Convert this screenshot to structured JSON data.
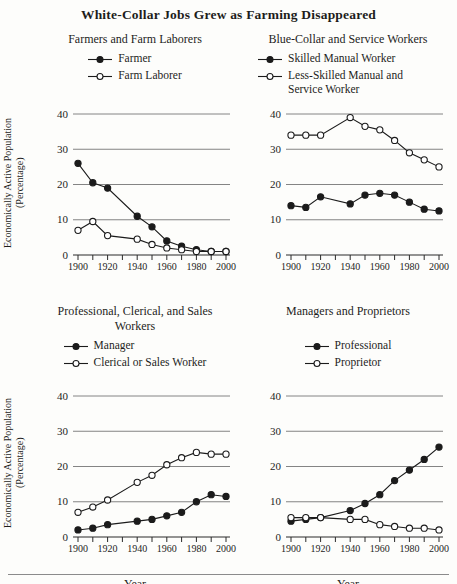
{
  "figure_title": "White-Collar Jobs Grew as Farming Disappeared",
  "y_axis_label": {
    "line1": "Economically Active Population",
    "line2": "(Percentage)"
  },
  "axes": {
    "y_ticks": [
      "0",
      "10",
      "20",
      "30",
      "40"
    ],
    "x_tick_labels": [
      "1900",
      "1920",
      "1940",
      "1960",
      "1980",
      "2000"
    ],
    "x_minor_tick_step_years": 10,
    "ylim": [
      0,
      40
    ],
    "xlim": [
      1900,
      2000
    ],
    "grid": "horizontal-only",
    "legend_position": "above-plot"
  },
  "colors": {
    "line": "#1b1b1b",
    "grid": "#767676",
    "axis": "#2b2b2b",
    "background": "#fdfdfb",
    "open_marker_fill": "#ffffff"
  },
  "chart_data": [
    {
      "type": "line",
      "title": "Farmers and Farm Laborers",
      "xlabel": "",
      "ylim": [
        0,
        40
      ],
      "x": [
        1900,
        1910,
        1920,
        1940,
        1950,
        1960,
        1970,
        1980,
        1990,
        2000
      ],
      "series": [
        {
          "name": "Farmer",
          "marker": "filled",
          "values": [
            26,
            20.5,
            19,
            11,
            8,
            4,
            2.5,
            1.5,
            1,
            1
          ]
        },
        {
          "name": "Farm Laborer",
          "marker": "open",
          "values": [
            7,
            9.5,
            5.5,
            4.5,
            3,
            2,
            1.5,
            1,
            1,
            1
          ]
        }
      ]
    },
    {
      "type": "line",
      "title": "Blue-Collar and Service Workers",
      "xlabel": "",
      "ylim": [
        0,
        40
      ],
      "x": [
        1900,
        1910,
        1920,
        1940,
        1950,
        1960,
        1970,
        1980,
        1990,
        2000
      ],
      "series": [
        {
          "name": "Skilled Manual Worker",
          "marker": "filled",
          "values": [
            14,
            13.5,
            16.5,
            14.5,
            17,
            17.5,
            17,
            15,
            13,
            12.5
          ]
        },
        {
          "name": "Less-Skilled Manual and Service Worker",
          "marker": "open",
          "values": [
            34,
            34,
            34,
            39,
            36.5,
            35.5,
            32.5,
            29,
            27,
            25
          ]
        }
      ]
    },
    {
      "type": "line",
      "title": "Professional, Clerical, and Sales Workers",
      "xlabel": "Year",
      "ylim": [
        0,
        40
      ],
      "x": [
        1900,
        1910,
        1920,
        1940,
        1950,
        1960,
        1970,
        1980,
        1990,
        2000
      ],
      "series": [
        {
          "name": "Manager",
          "marker": "filled",
          "values": [
            2,
            2.5,
            3.5,
            4.5,
            5,
            6,
            7,
            10,
            12,
            11.5
          ]
        },
        {
          "name": "Clerical or Sales Worker",
          "marker": "open",
          "values": [
            7,
            8.5,
            10.5,
            15.5,
            17.5,
            20.5,
            22.5,
            24,
            23.5,
            23.5
          ]
        }
      ]
    },
    {
      "type": "line",
      "title": "Managers and Proprietors",
      "xlabel": "Year",
      "ylim": [
        0,
        40
      ],
      "x": [
        1900,
        1910,
        1920,
        1940,
        1950,
        1960,
        1970,
        1980,
        1990,
        2000
      ],
      "series": [
        {
          "name": "Professional",
          "marker": "filled",
          "values": [
            4.5,
            5,
            5.5,
            7.5,
            9.5,
            12,
            16,
            19,
            22,
            25.5
          ]
        },
        {
          "name": "Proprietor",
          "marker": "open",
          "values": [
            5.5,
            5.5,
            5.5,
            5,
            5,
            3.5,
            3,
            2.5,
            2.5,
            2
          ]
        }
      ]
    }
  ]
}
